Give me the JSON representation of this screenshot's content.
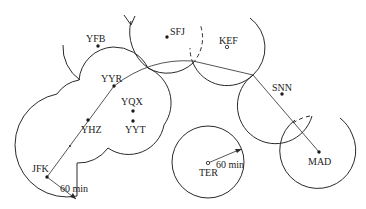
{
  "diagram": {
    "type": "ETOPS flight route diagram",
    "colors": {
      "line": "#2a2a2a",
      "text": "#222222",
      "background": "#ffffff"
    },
    "airports": [
      {
        "code": "JFK",
        "kind": "filled"
      },
      {
        "code": "YHZ",
        "kind": "filled"
      },
      {
        "code": "YYT",
        "kind": "filled"
      },
      {
        "code": "YQX",
        "kind": "filled"
      },
      {
        "code": "YYR",
        "kind": "filled"
      },
      {
        "code": "YFB",
        "kind": "filled"
      },
      {
        "code": "SFJ",
        "kind": "filled"
      },
      {
        "code": "KEF",
        "kind": "open"
      },
      {
        "code": "SNN",
        "kind": "filled"
      },
      {
        "code": "MAD",
        "kind": "filled"
      },
      {
        "code": "TER",
        "kind": "open"
      }
    ],
    "radius_labels": {
      "jfk": "60 min",
      "ter": "60 min"
    }
  }
}
